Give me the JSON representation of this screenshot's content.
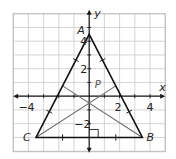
{
  "figure": {
    "type": "coordinate-plane-triangle",
    "grid": {
      "x_min": -5,
      "x_max": 5,
      "y_min": -4,
      "y_max": 6,
      "step": 1
    },
    "axes": {
      "x_label": "x",
      "y_label": "y",
      "x_tick_labels": [
        {
          "value": -4,
          "text": "−4"
        },
        {
          "value": 2,
          "text": "2"
        },
        {
          "value": 4,
          "text": "4"
        }
      ],
      "y_tick_labels": [
        {
          "value": 4,
          "text": "4"
        },
        {
          "value": 2,
          "text": "2"
        },
        {
          "value": -2,
          "text": "−2"
        }
      ]
    },
    "vertices": [
      {
        "name": "A",
        "x": 0,
        "y": 4.5
      },
      {
        "name": "B",
        "x": 3.5,
        "y": -3
      },
      {
        "name": "C",
        "x": -3.5,
        "y": -3
      }
    ],
    "point_label": {
      "name": "P",
      "x": 0.5,
      "y": 0.9
    },
    "medians": [
      {
        "from": "B",
        "to_midpoint_of": "AC"
      },
      {
        "from": "C",
        "to_midpoint_of": "AB"
      }
    ],
    "right_angle_marker": {
      "at": [
        0,
        -3
      ],
      "description": "altitude from A meets BC at right angle"
    },
    "congruence_ticks": "single tick on each half of AB, AC and BC",
    "colors": {
      "grid": "#c9c9c9",
      "border": "#bdbdbd",
      "axes": "#1a1a1a",
      "triangle": "#111111",
      "medians": "#6e6e6e",
      "label": "#222222"
    }
  }
}
